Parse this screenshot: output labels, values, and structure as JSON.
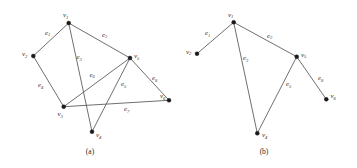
{
  "figure": {
    "panels": [
      {
        "id": "panel-a",
        "caption": "(a)",
        "caption_pos": {
          "x": 90,
          "y": 154
        },
        "vertices": [
          {
            "id": "v1",
            "label": "v",
            "sub": "1",
            "x": 68.7,
            "y": 23.0,
            "label_x": 63.0,
            "label_y": 17.0
          },
          {
            "id": "v2",
            "label": "v",
            "sub": "2",
            "x": 33.3,
            "y": 56.0,
            "label_x": 22.0,
            "label_y": 56.0
          },
          {
            "id": "v3",
            "label": "v",
            "sub": "3",
            "x": 63.7,
            "y": 106.7,
            "label_x": 57.5,
            "label_y": 116.0
          },
          {
            "id": "v4",
            "label": "v",
            "sub": "4",
            "x": 92.0,
            "y": 131.7,
            "label_x": 96.0,
            "label_y": 137.0
          },
          {
            "id": "v5",
            "label": "v",
            "sub": "5",
            "x": 130.0,
            "y": 58.0,
            "label_x": 134.0,
            "label_y": 58.0
          },
          {
            "id": "v6",
            "label": "v",
            "sub": "6",
            "x": 169.0,
            "y": 100.3,
            "label_x": 160.0,
            "label_y": 98.0
          }
        ],
        "edges": [
          {
            "id": "e1",
            "label": "e",
            "sub": "1",
            "from": "v1",
            "to": "v2",
            "label_x": 45.0,
            "label_y": 34.5
          },
          {
            "id": "e2",
            "label": "e",
            "sub": "2",
            "from": "v1",
            "to": "v5",
            "label_x": 102.0,
            "label_y": 36.5
          },
          {
            "id": "e3",
            "label": "e",
            "sub": "3",
            "from": "v1",
            "to": "v4",
            "label_x": 76.5,
            "label_y": 59.0
          },
          {
            "id": "e4",
            "label": "e",
            "sub": "4",
            "from": "v2",
            "to": "v3",
            "label_x": 38.0,
            "label_y": 87.0
          },
          {
            "id": "e5",
            "label": "e",
            "sub": "5",
            "from": "v4",
            "to": "v5",
            "label_x": 121.0,
            "label_y": 86.0
          },
          {
            "id": "e6",
            "label": "e",
            "sub": "6",
            "from": "v3",
            "to": "v5",
            "label_x": 89.5,
            "label_y": 76.5
          },
          {
            "id": "e7",
            "label": "e",
            "sub": "7",
            "from": "v3",
            "to": "v6",
            "label_x": 124.0,
            "label_y": 111.0
          },
          {
            "id": "e8",
            "label": "e",
            "sub": "8",
            "from": "v5",
            "to": "v6",
            "label_x": 152.0,
            "label_y": 80.0
          }
        ]
      },
      {
        "id": "panel-b",
        "caption": "(b)",
        "caption_pos": {
          "x": 264,
          "y": 154
        },
        "vertices": [
          {
            "id": "v1",
            "label": "v",
            "sub": "1",
            "x": 233.7,
            "y": 22.3,
            "label_x": 228.0,
            "label_y": 16.5
          },
          {
            "id": "v2",
            "label": "v",
            "sub": "2",
            "x": 197.0,
            "y": 53.7,
            "label_x": 186.0,
            "label_y": 53.5
          },
          {
            "id": "v4",
            "label": "v",
            "sub": "4",
            "x": 257.3,
            "y": 133.3,
            "label_x": 262.0,
            "label_y": 137.0
          },
          {
            "id": "v5",
            "label": "v",
            "sub": "5",
            "x": 296.7,
            "y": 56.7,
            "label_x": 301.0,
            "label_y": 56.5
          },
          {
            "id": "v6",
            "label": "v",
            "sub": "6",
            "x": 326.3,
            "y": 99.3,
            "label_x": 330.5,
            "label_y": 98.0
          }
        ],
        "edges": [
          {
            "id": "e1",
            "label": "e",
            "sub": "1",
            "from": "v1",
            "to": "v2",
            "label_x": 205.0,
            "label_y": 35.0
          },
          {
            "id": "e2",
            "label": "e",
            "sub": "2",
            "from": "v1",
            "to": "v5",
            "label_x": 267.0,
            "label_y": 37.5
          },
          {
            "id": "e3",
            "label": "e",
            "sub": "3",
            "from": "v1",
            "to": "v4",
            "label_x": 243.0,
            "label_y": 60.0
          },
          {
            "id": "e5",
            "label": "e",
            "sub": "5",
            "from": "v4",
            "to": "v5",
            "label_x": 286.0,
            "label_y": 86.0
          },
          {
            "id": "e8",
            "label": "e",
            "sub": "8",
            "from": "v5",
            "to": "v6",
            "label_x": 318.0,
            "label_y": 80.0
          }
        ]
      }
    ]
  }
}
